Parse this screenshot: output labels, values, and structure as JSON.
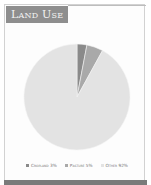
{
  "header": {
    "title": "Land Use"
  },
  "legend": [
    {
      "label": "Cropland 3%",
      "color": "#8a8a8a"
    },
    {
      "label": "Pasture 5%",
      "color": "#a9a9a9"
    },
    {
      "label": "Other 92%",
      "color": "#e3e3e3"
    }
  ],
  "chart_data": {
    "type": "pie",
    "title": "Land Use",
    "categories": [
      "Cropland",
      "Pasture",
      "Other"
    ],
    "values": [
      3,
      5,
      92
    ],
    "unit": "%",
    "colors": [
      "#8a8a8a",
      "#a9a9a9",
      "#e3e3e3"
    ],
    "legend_position": "bottom"
  }
}
